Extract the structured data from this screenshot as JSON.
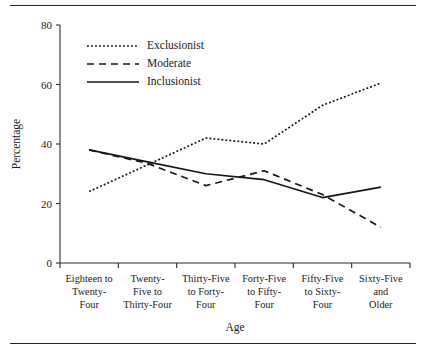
{
  "chart_data": {
    "type": "line",
    "title": "",
    "xlabel": "Age",
    "ylabel": "Percentage",
    "categories": [
      "Eighteen to Twenty-Four",
      "Twenty-Five to Thirty-Four",
      "Thirty-Five to Forty-Four",
      "Forty-Five to Fifty-Four",
      "Fifty-Five to Sixty-Four",
      "Sixty-Five and Older"
    ],
    "category_lines": [
      [
        "Eighteen to",
        "Twenty-",
        "Four"
      ],
      [
        "Twenty-",
        "Five to",
        "Thirty-Four"
      ],
      [
        "Thirty-Five",
        "to Forty-",
        "Four"
      ],
      [
        "Forty-Five",
        "to Fifty-",
        "Four"
      ],
      [
        "Fifty-Five",
        "to Sixty-",
        "Four"
      ],
      [
        "Sixty-Five",
        "and",
        "Older"
      ]
    ],
    "series": [
      {
        "name": "Exclusionist",
        "style": "dotted",
        "values": [
          24,
          33,
          42,
          40,
          53,
          60.5
        ]
      },
      {
        "name": "Moderate",
        "style": "dashed",
        "values": [
          38,
          33.5,
          26,
          31,
          23,
          12
        ]
      },
      {
        "name": "Inclusionist",
        "style": "solid",
        "values": [
          38,
          34,
          30,
          28,
          22,
          25.5
        ]
      }
    ],
    "ylim": [
      0,
      80
    ],
    "yticks": [
      0,
      20,
      40,
      60,
      80
    ],
    "ytick_labels": [
      "0",
      "20",
      "40",
      "60",
      "80"
    ],
    "grid": false,
    "legend_position": "top-left"
  },
  "legend": {
    "entries": [
      {
        "label": "Exclusionist"
      },
      {
        "label": "Moderate"
      },
      {
        "label": "Inclusionist"
      }
    ]
  },
  "colors": {
    "ink": "#1a1a1a",
    "axis": "#2b2b2b",
    "series": "#161616",
    "rule": "#262626",
    "background": "#ffffff"
  }
}
